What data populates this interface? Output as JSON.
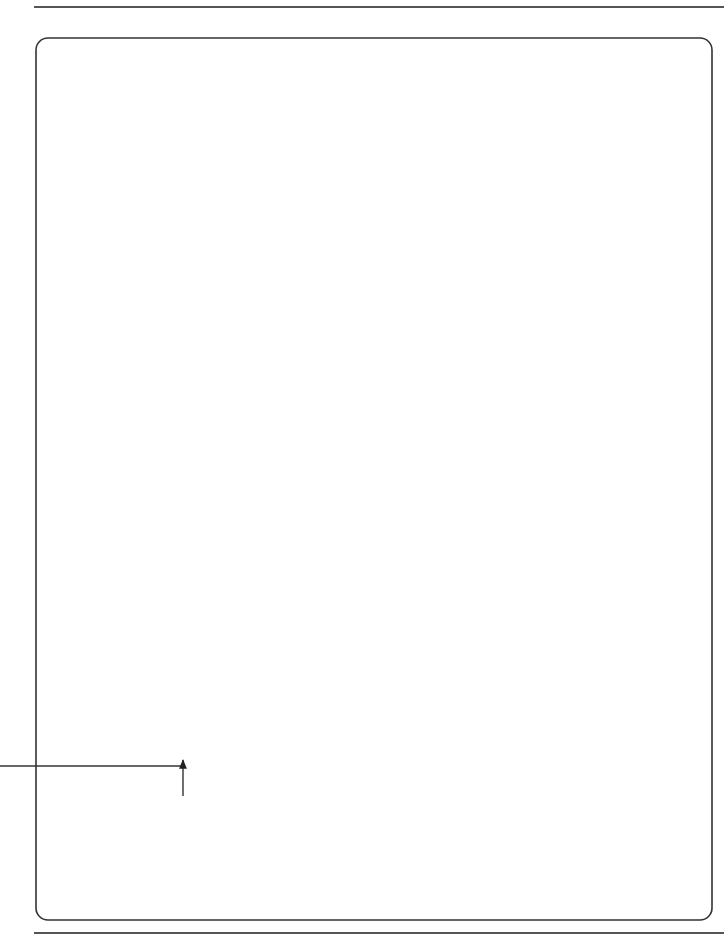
{
  "page": {
    "caption": {
      "number": "Flow chart 33",
      "title": "Instruction to stop or not to start work"
    }
  },
  "nodes": {
    "start": {
      "label": "Start"
    },
    "step_34_1": {
      "ref": "34.1",
      "lines": [
        "The E may instruct the C to",
        "stop or not to start any work"
      ]
    },
    "decision_34_1": {
      "ref": "34.1",
      "lines": [
        "Does the E",
        "issue such an",
        "instruction?"
      ],
      "yes": "YES",
      "no": "NO"
    },
    "fc13_a": {
      "heading": [
        "INSTRUCTION TO STOP",
        "OR NOT START WORK"
      ],
      "lines": [
        "FC 13",
        "Instruction"
      ]
    },
    "fc61": {
      "heading": [
        "COMPENSATION EVENT"
      ],
      "lines": [
        "FC 61",
        "Notify CE 60.1(4)"
      ]
    },
    "obey_a": {
      "heading": [
        "OBEY INSTRUCTION"
      ],
      "ref": "25.3",
      "lines": [
        "The C obeys an instruction",
        "which is in accordance",
        "with this contract and is",
        "given to him by the E"
      ]
    },
    "step_33_1": {
      "heading": [
        "RE-START OR START WORK"
      ],
      "ref": "33.1",
      "lines": [
        "The E may later instruct",
        "the C that he may re-start",
        "or start it"
      ]
    },
    "decision_33_1": {
      "ref": "33.1",
      "lines": [
        "Does the PM",
        "issue such an",
        "instruction?"
      ],
      "yes": "YES",
      "no": "NO"
    },
    "fc13_b": {
      "heading": [
        "INSTRUCTION TO RE-START",
        "OR TO START WORK"
      ],
      "lines": [
        "FC 13",
        "Instruction"
      ]
    },
    "obey_b": {
      "heading": [
        "OBEY INSTRUCTION"
      ],
      "ref": "25.3",
      "lines": [
        "The C obeys an instruction",
        "which is in accordance",
        "with this contract and is",
        "given to him by the E"
      ]
    },
    "finish": {
      "label": "Finish"
    }
  },
  "colors": {
    "stroke": "#222222",
    "frame": "#333333",
    "rule": "#555555",
    "background": "#ffffff"
  }
}
